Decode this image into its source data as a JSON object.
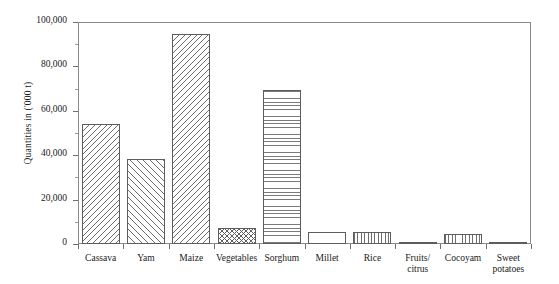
{
  "chart_data": {
    "type": "bar",
    "title": "",
    "xlabel": "",
    "ylabel": "Quantities in ('000 t)",
    "ylim": [
      0,
      100000
    ],
    "ytick_labels": [
      "0",
      "20,000",
      "40,000",
      "60,000",
      "80,000",
      "100,000"
    ],
    "ytick_values": [
      0,
      20000,
      40000,
      60000,
      80000,
      100000
    ],
    "grid": false,
    "legend": "none",
    "categories": [
      "Cassava",
      "Yam",
      "Maize",
      "Vegetables",
      "Sorghum",
      "Millet",
      "Rice",
      "Fruits/\ncitrus",
      "Cocoyam",
      "Sweet\npotatoes"
    ],
    "values": [
      54000,
      38500,
      94500,
      7200,
      69500,
      5500,
      5400,
      700,
      4700,
      600
    ],
    "fills": [
      "back-diagonal-hatch",
      "forward-diagonal-hatch",
      "back-diagonal-hatch",
      "cross-hatch",
      "horizontal-line-hatch",
      "blank",
      "vertical-line-hatch",
      "blank",
      "vertical-line-hatch",
      "blank"
    ],
    "bar_edge_color": "#5d5d5d",
    "axis_color": "#8a8a8a",
    "background_color": "#ffffff"
  }
}
